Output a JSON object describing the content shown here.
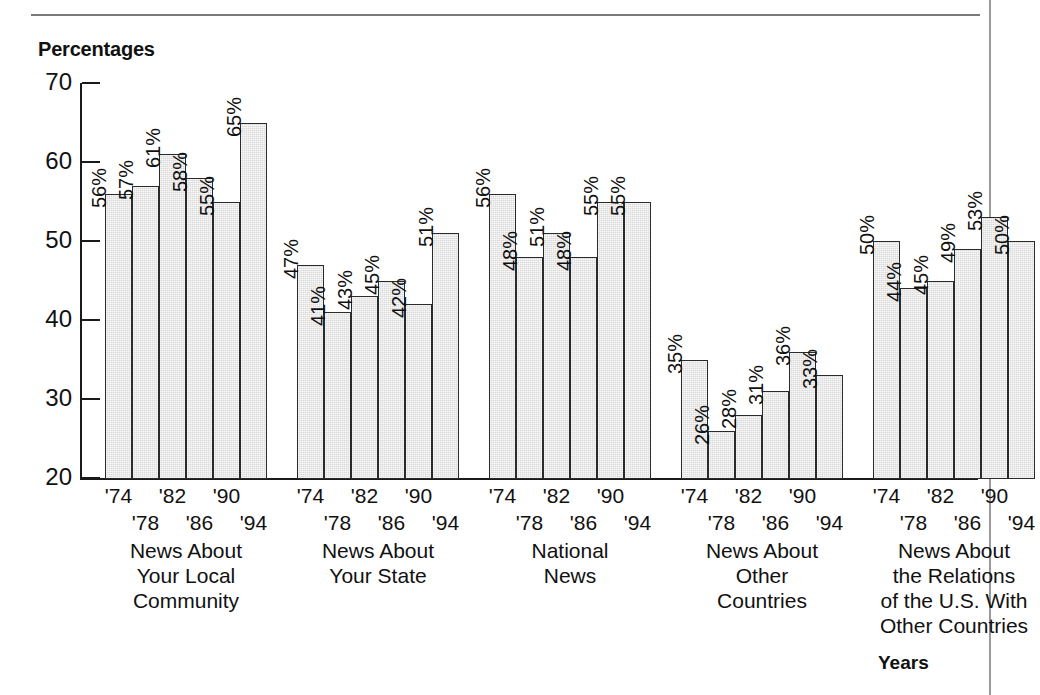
{
  "page": {
    "clipped_top_text": "",
    "years_label": "Years"
  },
  "chart_data": {
    "type": "bar",
    "title": "Percentages",
    "xlabel": "Years",
    "ylabel": "",
    "ylim": [
      20,
      70
    ],
    "ytick_labels": [
      "70",
      "60",
      "50",
      "40",
      "30",
      "20"
    ],
    "ytick_values": [
      70,
      60,
      50,
      40,
      30,
      20
    ],
    "grid": false,
    "legend": "none",
    "value_label_suffix": "%",
    "categories": [
      "'74",
      "'78",
      "'82",
      "'86",
      "'90",
      "'94"
    ],
    "groups": [
      {
        "caption_lines": [
          "News About",
          "Your Local",
          "Community"
        ],
        "values": [
          56,
          57,
          61,
          58,
          55,
          65
        ],
        "value_labels": [
          "56%",
          "57%",
          "61%",
          "58%",
          "55%",
          "65%"
        ]
      },
      {
        "caption_lines": [
          "News About",
          "Your State"
        ],
        "values": [
          47,
          41,
          43,
          45,
          42,
          51
        ],
        "value_labels": [
          "47%",
          "41%",
          "43%",
          "45%",
          "42%",
          "51%"
        ]
      },
      {
        "caption_lines": [
          "National",
          "News"
        ],
        "values": [
          56,
          48,
          51,
          48,
          55,
          55
        ],
        "value_labels": [
          "56%",
          "48%",
          "51%",
          "48%",
          "55%",
          "55%"
        ]
      },
      {
        "caption_lines": [
          "News About",
          "Other",
          "Countries"
        ],
        "values": [
          35,
          26,
          28,
          31,
          36,
          33
        ],
        "value_labels": [
          "35%",
          "26%",
          "28%",
          "31%",
          "36%",
          "33%"
        ]
      },
      {
        "caption_lines": [
          "News About",
          "the Relations",
          "of the U.S. With",
          "Other Countries"
        ],
        "values": [
          50,
          44,
          45,
          49,
          53,
          50
        ],
        "value_labels": [
          "50%",
          "44%",
          "45%",
          "49%",
          "53%",
          "50%"
        ]
      }
    ],
    "colors": {
      "bar_fill": "#dadada",
      "bar_stroke": "#2a2a2a",
      "axis": "#1a1a1a",
      "text": "#111111"
    }
  }
}
